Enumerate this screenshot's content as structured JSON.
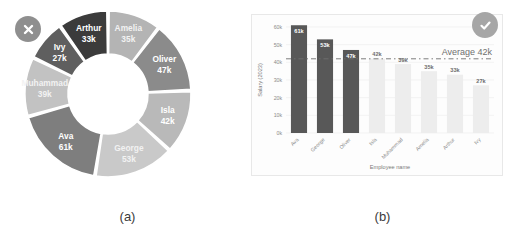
{
  "figure": {
    "panel_a_caption": "(a)",
    "panel_b_caption": "(b)",
    "badge_a": "x-circle-icon",
    "badge_b": "check-circle-icon"
  },
  "chart_data": [
    {
      "type": "pie",
      "variant": "donut",
      "title": "",
      "xlabel": "",
      "ylabel": "",
      "legend": "none",
      "labels_inside_slices": true,
      "start_angle_deg": -90,
      "direction": "clockwise",
      "categories": [
        "Amelia",
        "Oliver",
        "Isla",
        "George",
        "Ava",
        "Muhammad",
        "Ivy",
        "Arthur"
      ],
      "values": [
        35,
        47,
        42,
        53,
        61,
        39,
        27,
        33
      ],
      "value_labels": [
        "35k",
        "47k",
        "42k",
        "53k",
        "61k",
        "39k",
        "27k",
        "33k"
      ],
      "colors": [
        "#b4b4b4",
        "#8b8b8b",
        "#b9b9b9",
        "#c9c9c9",
        "#7e7e7e",
        "#c2c2c2",
        "#5f5f5f",
        "#3b3b3b"
      ],
      "total": 337,
      "units": "thousands"
    },
    {
      "type": "bar",
      "title": "",
      "xlabel": "Employee name",
      "ylabel": "Salary (2023)",
      "categories": [
        "Ava",
        "George",
        "Oliver",
        "Isla",
        "Muhammad",
        "Amelia",
        "Arthur",
        "Ivy"
      ],
      "values": [
        61,
        53,
        47,
        42,
        39,
        35,
        33,
        27
      ],
      "value_labels": [
        "61k",
        "53k",
        "47k",
        "42k",
        "39k",
        "35k",
        "33k",
        "27k"
      ],
      "bar_colors": [
        "#585858",
        "#585858",
        "#585858",
        "#ededed",
        "#ededed",
        "#ededed",
        "#ededed",
        "#ededed"
      ],
      "above_average_flags": [
        true,
        true,
        true,
        false,
        false,
        false,
        false,
        false
      ],
      "ylim": [
        0,
        60
      ],
      "yticks": [
        0,
        10,
        20,
        30,
        40,
        50,
        60
      ],
      "ytick_labels": [
        "0k",
        "10k",
        "20k",
        "30k",
        "40k",
        "50k",
        "60k"
      ],
      "grid": true,
      "reference_line": {
        "label": "Average 42k",
        "value": 42,
        "style": "dashed",
        "color": "#6f6f6f"
      },
      "legend": "none",
      "units": "thousands"
    }
  ]
}
